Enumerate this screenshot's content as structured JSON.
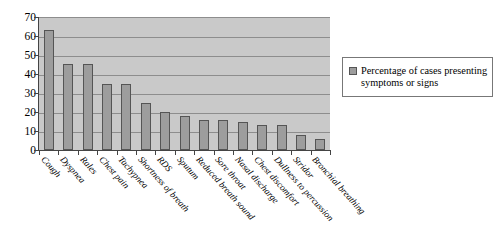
{
  "chart_data": {
    "type": "bar",
    "title": "",
    "subtitle": "",
    "xlabel": "",
    "ylabel": "",
    "ylim": [
      0,
      70
    ],
    "ytick_labels": [
      "70",
      "60",
      "50",
      "40",
      "30",
      "20",
      "10",
      "0"
    ],
    "yticks": [
      70,
      60,
      50,
      40,
      30,
      20,
      10,
      0
    ],
    "grid": true,
    "legend_position": "right",
    "legend": [
      "Percentage of cases presenting symptoms or signs"
    ],
    "categories": [
      "Cough",
      "Dyspnea",
      "Rales",
      "Chest pain",
      "Tachypnea",
      "Shortness of breath",
      "RDS",
      "Sputum",
      "Reduced breath sound",
      "Sore throat",
      "Nasal discharge",
      "Chest discomfort",
      "Dullness to percussion",
      "Stridor",
      "Bronchial breathing"
    ],
    "series": [
      {
        "name": "Percentage of cases presenting symptoms or signs",
        "values": [
          63,
          45.5,
          45.5,
          35,
          35,
          25,
          20,
          18,
          16,
          16,
          15,
          13,
          13,
          8,
          6
        ]
      }
    ]
  },
  "legend": {
    "line1": "Percentage of cases",
    "line2": "presenting symptoms or signs",
    "swatch_color": "#9d9d9d"
  },
  "colors": {
    "bar_fill": "#9d9d9d",
    "bar_border": "#555555",
    "plot_background": "#c9c9c9",
    "gridline": "#8d8d8d",
    "axis": "#444444",
    "legend_border": "#777777",
    "text": "#000000"
  }
}
